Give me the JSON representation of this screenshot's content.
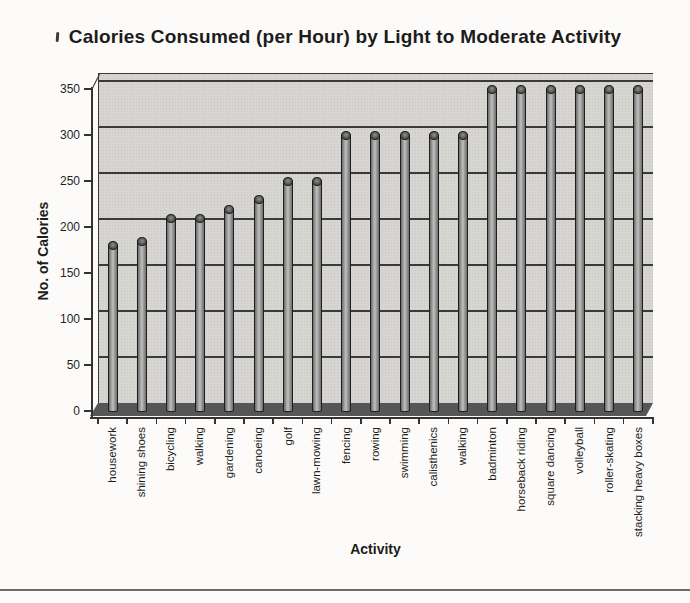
{
  "chart_data": {
    "type": "bar",
    "style": "3d-cylinder-grayscale",
    "title": "Calories Consumed (per Hour) by Light to Moderate Activity",
    "xlabel": "Activity",
    "ylabel": "No. of Calories",
    "ylim": [
      0,
      350
    ],
    "ytick_interval": 50,
    "yticks": [
      0,
      50,
      100,
      150,
      200,
      250,
      300,
      350
    ],
    "grid": true,
    "legend": false,
    "x_label_rotation_deg": -90,
    "categories": [
      "housework",
      "shining shoes",
      "bicycling",
      "walking",
      "gardening",
      "canoeing",
      "golf",
      "lawn-mowing",
      "fencing",
      "rowing",
      "swimming",
      "calisthenics",
      "walking",
      "badminton",
      "horseback riding",
      "square dancing",
      "volleyball",
      "roller-skating",
      "stacking heavy boxes"
    ],
    "values": [
      180,
      185,
      210,
      210,
      220,
      230,
      250,
      250,
      300,
      300,
      300,
      300,
      300,
      350,
      350,
      350,
      350,
      350,
      350
    ]
  },
  "colors": {
    "page_background": "#fcfbf9",
    "wall": "#d7d5d1",
    "floor": "#565656",
    "grid": "#3a3a38",
    "axis": "#333333",
    "bar_dark": "#6b6b6b",
    "bar_light": "#bfbfbf",
    "bar_outline": "#1f1f1f",
    "text": "#1f1f1f",
    "bottom_rule": "#6b6b6b"
  }
}
